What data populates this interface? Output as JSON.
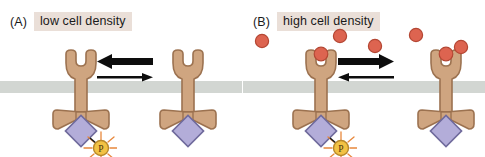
{
  "figure": {
    "width": 485,
    "height": 157,
    "background": "#ffffff",
    "topic": "receptor activation as a function of cell density (quorum sensing)"
  },
  "colors": {
    "protein_fill": "#cfa580",
    "protein_stroke": "#9c7250",
    "membrane": "#d2d6d2",
    "kinase_fill": "#b3add9",
    "kinase_stroke": "#6f6a9c",
    "ligand_fill": "#dd6450",
    "ligand_stroke": "#b44734",
    "phosphate_fill": "#f2c244",
    "phosphate_stroke": "#b8882a",
    "sunburst": "#e8883c",
    "arrow": "#0d0d0d",
    "label_highlight": "#eadfd8",
    "text": "#1a1a1a"
  },
  "panels": [
    {
      "id": "a",
      "letter": "(A)",
      "title": "low cell density",
      "membrane": {
        "top": 81,
        "height": 12
      },
      "arrows": {
        "major_direction": "left",
        "minor_direction": "right",
        "meaning": "equilibrium favors the unbound / monomeric state"
      },
      "ligands": [],
      "receptors": [
        {
          "name": "receptor-left",
          "x": 45,
          "ligand_bound": false,
          "phosphorylated": true,
          "phosphate_label": "P"
        },
        {
          "name": "receptor-right",
          "x": 152,
          "ligand_bound": false,
          "phosphorylated": false,
          "phosphate_label": "P"
        }
      ]
    },
    {
      "id": "b",
      "letter": "(B)",
      "title": "high cell density",
      "membrane": {
        "top": 81,
        "height": 12
      },
      "arrows": {
        "major_direction": "right",
        "minor_direction": "left",
        "meaning": "equilibrium favors the ligand-bound / signaling state"
      },
      "ligands": [
        {
          "x": 18,
          "y": 40,
          "r": 7,
          "bound": false
        },
        {
          "x": 52,
          "y": 55,
          "r": 7,
          "bound": true
        },
        {
          "x": 96,
          "y": 35,
          "r": 7,
          "bound": false
        },
        {
          "x": 131,
          "y": 45,
          "r": 7,
          "bound": false
        },
        {
          "x": 177,
          "y": 55,
          "r": 7,
          "bound": true
        },
        {
          "x": 172,
          "y": 34,
          "r": 7,
          "bound": false
        },
        {
          "x": 217,
          "y": 46,
          "r": 7,
          "bound": false
        }
      ],
      "receptors": [
        {
          "name": "receptor-left",
          "x": 42,
          "ligand_bound": true,
          "phosphorylated": true,
          "phosphate_label": "P"
        },
        {
          "name": "receptor-right",
          "x": 167,
          "ligand_bound": true,
          "phosphorylated": false,
          "phosphate_label": "P"
        }
      ]
    }
  ]
}
